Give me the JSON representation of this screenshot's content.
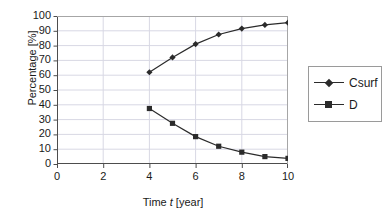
{
  "chart_data": {
    "type": "line",
    "title": "",
    "xlabel": "Time t [year]",
    "xlabel_prefix": "Time ",
    "xlabel_italic": "t",
    "xlabel_suffix": " [year]",
    "ylabel": "Percentage [%]",
    "xlim": [
      0,
      10
    ],
    "ylim": [
      0,
      100
    ],
    "xticks": [
      0,
      2,
      4,
      6,
      8,
      10
    ],
    "yticks": [
      0,
      10,
      20,
      30,
      40,
      50,
      60,
      70,
      80,
      90,
      100
    ],
    "grid": true,
    "legend_position": "right",
    "x": [
      4,
      5,
      6,
      7,
      8,
      9,
      10
    ],
    "series": [
      {
        "name": "Csurf",
        "marker": "diamond",
        "color": "#2b2b2b",
        "values": [
          62,
          72,
          81,
          87.5,
          91.5,
          94,
          95.5
        ]
      },
      {
        "name": "D",
        "marker": "square",
        "color": "#2b2b2b",
        "values": [
          37.5,
          27.5,
          18.5,
          12,
          8,
          5,
          3.8
        ]
      }
    ]
  },
  "legend": {
    "items": [
      {
        "label": "Csurf",
        "marker": "diamond"
      },
      {
        "label": "D",
        "marker": "square"
      }
    ]
  },
  "colors": {
    "axis": "#4d4d4d",
    "grid": "#d8d8e4",
    "series": "#2b2b2b",
    "text": "#1a1a1a",
    "background": "#ffffff"
  }
}
